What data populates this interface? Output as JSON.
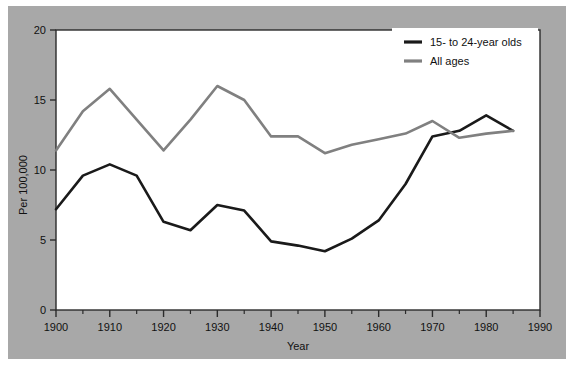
{
  "figure": {
    "background_color": "#ffffff",
    "backdrop_color": "#a8a8a8",
    "plot_background_color": "#ffffff",
    "frame_color": "#2b2b2b"
  },
  "chart_data": {
    "type": "line",
    "title": "",
    "xlabel": "Year",
    "ylabel": "Per 100,000",
    "xlim": [
      1900,
      1990
    ],
    "ylim": [
      0,
      20
    ],
    "xticks": [
      1900,
      1910,
      1920,
      1930,
      1940,
      1950,
      1960,
      1970,
      1980,
      1990
    ],
    "xtick_labels": [
      "1900",
      "1910",
      "1920",
      "1930",
      "1940",
      "1950",
      "1960",
      "1970",
      "1980",
      "1990"
    ],
    "xminor_ticks": [
      1905,
      1915,
      1925,
      1935,
      1945,
      1955,
      1965,
      1975,
      1985
    ],
    "yticks": [
      0,
      5,
      10,
      15,
      20
    ],
    "ytick_labels": [
      "0",
      "5",
      "10",
      "15",
      "20"
    ],
    "grid": false,
    "legend_position": "top-right",
    "x": [
      1900,
      1905,
      1910,
      1915,
      1920,
      1925,
      1930,
      1935,
      1940,
      1945,
      1950,
      1955,
      1960,
      1965,
      1970,
      1975,
      1980,
      1985
    ],
    "series": [
      {
        "name": "15- to 24-year olds",
        "color": "#1a1a1a",
        "values": [
          7.2,
          9.6,
          10.4,
          9.6,
          6.3,
          5.7,
          7.5,
          7.1,
          4.9,
          4.6,
          4.2,
          5.1,
          6.4,
          9.0,
          12.4,
          12.8,
          13.9,
          12.8
        ]
      },
      {
        "name": "All ages",
        "color": "#808080",
        "values": [
          11.4,
          14.2,
          15.8,
          13.6,
          11.4,
          13.6,
          16.0,
          15.0,
          12.4,
          12.4,
          11.2,
          11.8,
          12.2,
          12.6,
          13.5,
          12.3,
          12.6,
          12.8
        ]
      }
    ]
  },
  "legend": {
    "entries": [
      {
        "label": "15- to 24-year olds",
        "color": "#1a1a1a"
      },
      {
        "label": "All ages",
        "color": "#808080"
      }
    ]
  }
}
